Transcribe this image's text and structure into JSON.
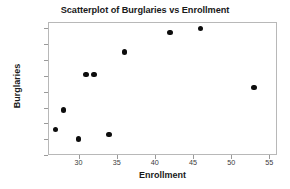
{
  "chart_data": {
    "type": "scatter",
    "title": "Scatterplot of Burglaries vs Enrollment",
    "xlabel": "Enrollment",
    "ylabel": "Burglaries",
    "xlim": [
      26,
      56
    ],
    "ylim": [
      0,
      168
    ],
    "xticks": [
      30,
      35,
      40,
      45,
      50,
      55
    ],
    "yticks": [
      0,
      20,
      40,
      60,
      80,
      100,
      120,
      140,
      160
    ],
    "grid": false,
    "legend": false,
    "marker": "filled-circle",
    "marker_color": "#0d0d0d",
    "points": [
      {
        "x": 27,
        "y": 32
      },
      {
        "x": 28,
        "y": 57
      },
      {
        "x": 30,
        "y": 20
      },
      {
        "x": 31,
        "y": 102
      },
      {
        "x": 32,
        "y": 102
      },
      {
        "x": 34,
        "y": 26
      },
      {
        "x": 36,
        "y": 130
      },
      {
        "x": 42,
        "y": 155
      },
      {
        "x": 46,
        "y": 160
      },
      {
        "x": 53,
        "y": 85
      }
    ]
  }
}
